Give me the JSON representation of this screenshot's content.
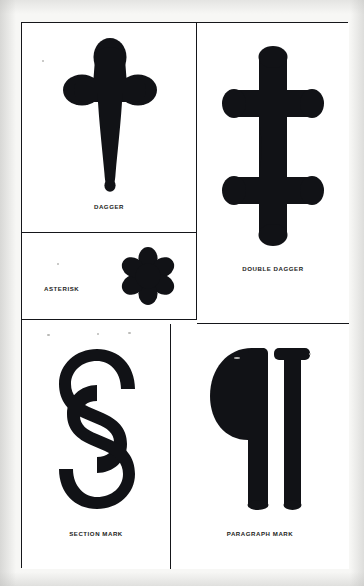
{
  "plate": {
    "title": "Reference Marks",
    "background_color": "#f7f7f5",
    "ink_color": "#111216",
    "border_color": "#15161a"
  },
  "panels": [
    {
      "id": "dagger",
      "label": "DAGGER",
      "symbol": "†",
      "symbol_name": "dagger-glyph",
      "label_align": "center",
      "row": 1,
      "column": "left"
    },
    {
      "id": "asterisk",
      "label": "ASTERISK",
      "symbol": "✱",
      "symbol_name": "asterisk-glyph",
      "label_align": "left",
      "row": 2,
      "column": "left"
    },
    {
      "id": "double-dagger",
      "label": "DOUBLE DAGGER",
      "symbol": "‡",
      "symbol_name": "double-dagger-glyph",
      "label_align": "center",
      "row": 1,
      "column": "right"
    },
    {
      "id": "section-mark",
      "label": "SECTION MARK",
      "symbol": "§",
      "symbol_name": "section-mark-glyph",
      "label_align": "center",
      "row": 3,
      "column": "left"
    },
    {
      "id": "paragraph-mark",
      "label": "PARAGRAPH MARK",
      "symbol": "¶",
      "symbol_name": "paragraph-mark-glyph",
      "label_align": "center",
      "row": 3,
      "column": "right"
    }
  ]
}
